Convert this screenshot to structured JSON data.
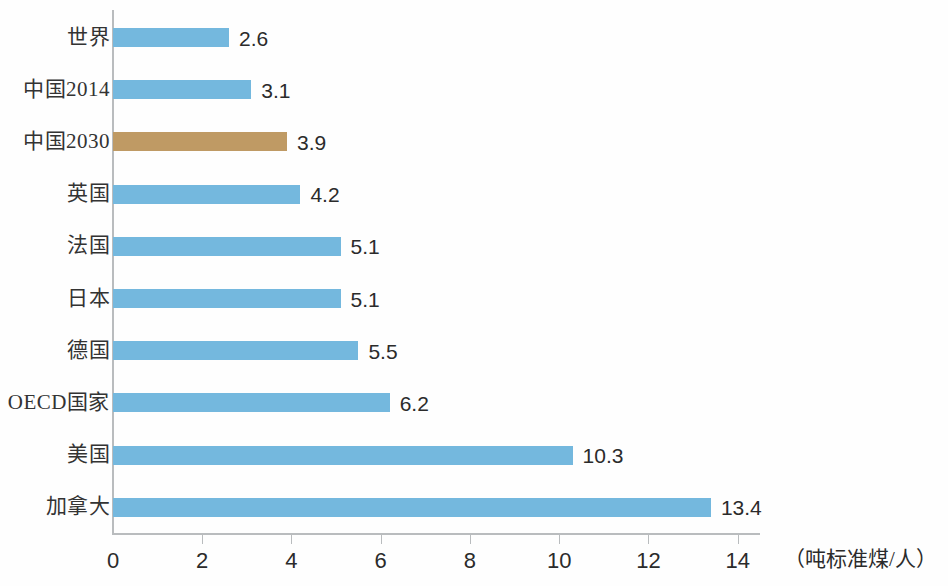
{
  "chart_data": {
    "type": "bar",
    "orientation": "horizontal",
    "title": "",
    "subtitle": "",
    "xlabel": "（吨标准煤/人）",
    "ylabel": "",
    "xlim": [
      0,
      14.5
    ],
    "xticks": [
      0,
      2,
      4,
      6,
      8,
      10,
      12,
      14
    ],
    "xtick_labels": [
      "0",
      "2",
      "4",
      "6",
      "8",
      "10",
      "12",
      "14"
    ],
    "grid": false,
    "legend": "none",
    "categories": [
      "世界",
      "中国2014",
      "中国2030",
      "英国",
      "法国",
      "日本",
      "德国",
      "OECD国家",
      "美国",
      "加拿大"
    ],
    "values": [
      2.6,
      3.1,
      3.9,
      4.2,
      5.1,
      5.1,
      5.5,
      6.2,
      10.3,
      13.4
    ],
    "value_labels": [
      "2.6",
      "3.1",
      "3.9",
      "4.2",
      "5.1",
      "5.1",
      "5.5",
      "6.2",
      "10.3",
      "13.4"
    ],
    "bar_colors": [
      "#74b8de",
      "#74b8de",
      "#bf9a64",
      "#74b8de",
      "#74b8de",
      "#74b8de",
      "#74b8de",
      "#74b8de",
      "#74b8de",
      "#74b8de"
    ],
    "highlight_index": 2,
    "series": [
      {
        "name": "人均能源消费",
        "values": [
          2.6,
          3.1,
          3.9,
          4.2,
          5.1,
          5.1,
          5.5,
          6.2,
          10.3,
          13.4
        ]
      }
    ]
  },
  "colors": {
    "bar_blue": "#74b8de",
    "bar_brown": "#bf9a64",
    "axis": "#b9bcbe",
    "text": "#2b2b2b",
    "background": "#fefefe"
  },
  "rows": [
    {
      "label": "世界",
      "value": "2.6",
      "num": 2.6,
      "color": "#74b8de"
    },
    {
      "label": "中国2014",
      "value": "3.1",
      "num": 3.1,
      "color": "#74b8de"
    },
    {
      "label": "中国2030",
      "value": "3.9",
      "num": 3.9,
      "color": "#bf9a64"
    },
    {
      "label": "英国",
      "value": "4.2",
      "num": 4.2,
      "color": "#74b8de"
    },
    {
      "label": "法国",
      "value": "5.1",
      "num": 5.1,
      "color": "#74b8de"
    },
    {
      "label": "日本",
      "value": "5.1",
      "num": 5.1,
      "color": "#74b8de"
    },
    {
      "label": "德国",
      "value": "5.5",
      "num": 5.5,
      "color": "#74b8de"
    },
    {
      "label": "OECD国家",
      "value": "6.2",
      "num": 6.2,
      "color": "#74b8de"
    },
    {
      "label": "美国",
      "value": "10.3",
      "num": 10.3,
      "color": "#74b8de"
    },
    {
      "label": "加拿大",
      "value": "13.4",
      "num": 13.4,
      "color": "#74b8de"
    }
  ],
  "axis": {
    "unit_caption": "（吨标准煤/人）",
    "ticks": [
      "0",
      "2",
      "4",
      "6",
      "8",
      "10",
      "12",
      "14"
    ]
  }
}
